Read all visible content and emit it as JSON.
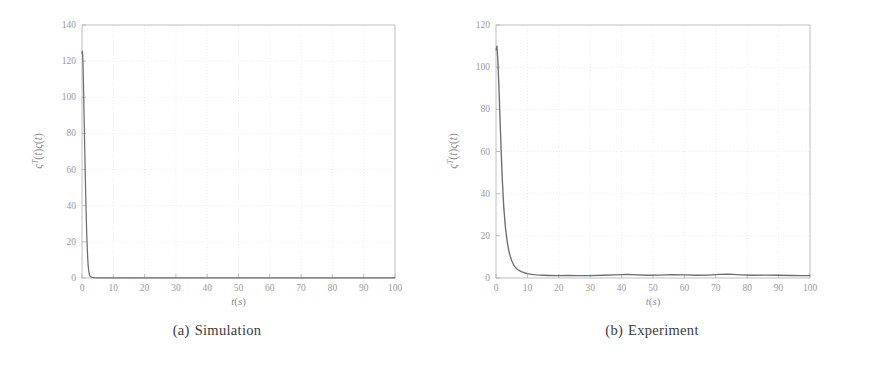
{
  "figure": {
    "panels": [
      {
        "id": "a",
        "caption_tag": "(a)",
        "caption_text": "Simulation"
      },
      {
        "id": "b",
        "caption_tag": "(b)",
        "caption_text": "Experiment"
      }
    ]
  },
  "chart_data": [
    {
      "type": "line",
      "title": "",
      "panel_label": "(a) Simulation",
      "xlabel": "t(s)",
      "ylabel": "ς^T(t)ς(t)",
      "ylabel_plain": "zeta^T(t) zeta(t)",
      "xlim": [
        0,
        100
      ],
      "ylim": [
        0,
        140
      ],
      "xticks": [
        0,
        10,
        20,
        30,
        40,
        50,
        60,
        70,
        80,
        90,
        100
      ],
      "xticklabels": [
        "0",
        "10",
        "20",
        "30",
        "40",
        "50",
        "60",
        "70",
        "80",
        "90",
        "100"
      ],
      "yticks": [
        0,
        20,
        40,
        60,
        80,
        100,
        120,
        140
      ],
      "yticklabels": [
        "0",
        "20",
        "40",
        "60",
        "80",
        "100",
        "120",
        "140"
      ],
      "grid": true,
      "legend": null,
      "line_color": "#6d6d6d",
      "series": [
        {
          "name": "zeta^T zeta (simulation)",
          "x": [
            0.0,
            0.1,
            0.2,
            0.3,
            0.4,
            0.5,
            0.6,
            0.7,
            0.8,
            0.9,
            1.0,
            1.1,
            1.2,
            1.3,
            1.4,
            1.5,
            1.6,
            1.7,
            1.8,
            1.9,
            2.0,
            2.2,
            2.4,
            2.6,
            2.8,
            3.0,
            3.5,
            4.0,
            5.0,
            6.0,
            8.0,
            10.0,
            15.0,
            20.0,
            30.0,
            40.0,
            50.0,
            60.0,
            70.0,
            80.0,
            90.0,
            100.0
          ],
          "y": [
            124.0,
            125.5,
            124.0,
            120.0,
            113.0,
            105.0,
            96.0,
            87.0,
            78.0,
            69.0,
            60.5,
            52.5,
            45.0,
            38.0,
            31.5,
            25.5,
            20.5,
            16.0,
            12.0,
            8.8,
            6.2,
            3.2,
            1.7,
            1.0,
            0.65,
            0.45,
            0.25,
            0.18,
            0.12,
            0.1,
            0.08,
            0.07,
            0.06,
            0.06,
            0.05,
            0.05,
            0.05,
            0.05,
            0.05,
            0.05,
            0.05,
            0.05
          ]
        }
      ]
    },
    {
      "type": "line",
      "title": "",
      "panel_label": "(b) Experiment",
      "xlabel": "t(s)",
      "ylabel": "ς^T(t)ς(t)",
      "ylabel_plain": "zeta^T(t) zeta(t)",
      "xlim": [
        0,
        100
      ],
      "ylim": [
        0,
        120
      ],
      "xticks": [
        0,
        10,
        20,
        30,
        40,
        50,
        60,
        70,
        80,
        90,
        100
      ],
      "xticklabels": [
        "0",
        "10",
        "20",
        "30",
        "40",
        "50",
        "60",
        "70",
        "80",
        "90",
        "100"
      ],
      "yticks": [
        0,
        20,
        40,
        60,
        80,
        100,
        120
      ],
      "yticklabels": [
        "0",
        "20",
        "40",
        "60",
        "80",
        "100",
        "120"
      ],
      "grid": true,
      "legend": null,
      "line_color": "#6d6d6d",
      "series": [
        {
          "name": "zeta^T zeta (experiment)",
          "x": [
            0.0,
            0.3,
            0.6,
            0.9,
            1.2,
            1.5,
            1.8,
            2.1,
            2.5,
            3.0,
            3.5,
            4.0,
            4.5,
            5.0,
            5.5,
            6.0,
            6.5,
            7.0,
            8.0,
            9.0,
            10.0,
            11.0,
            12.0,
            13.0,
            14.0,
            15.0,
            17.0,
            20.0,
            23.0,
            26.0,
            30.0,
            34.0,
            38.0,
            42.0,
            45.0,
            48.0,
            52.0,
            56.0,
            60.0,
            64.0,
            68.0,
            71.0,
            74.0,
            78.0,
            82.0,
            86.0,
            90.0,
            94.0,
            97.0,
            100.0
          ],
          "y": [
            108.0,
            110.0,
            103.0,
            92.0,
            79.0,
            66.0,
            54.0,
            44.0,
            33.0,
            24.0,
            18.0,
            13.5,
            10.5,
            8.2,
            6.6,
            5.4,
            4.5,
            3.9,
            3.0,
            2.5,
            2.1,
            1.8,
            1.6,
            1.45,
            1.35,
            1.3,
            1.2,
            1.15,
            1.2,
            1.1,
            1.15,
            1.3,
            1.5,
            1.7,
            1.5,
            1.3,
            1.4,
            1.6,
            1.5,
            1.3,
            1.4,
            1.7,
            1.8,
            1.5,
            1.3,
            1.4,
            1.3,
            1.2,
            1.15,
            1.1
          ]
        }
      ]
    }
  ]
}
